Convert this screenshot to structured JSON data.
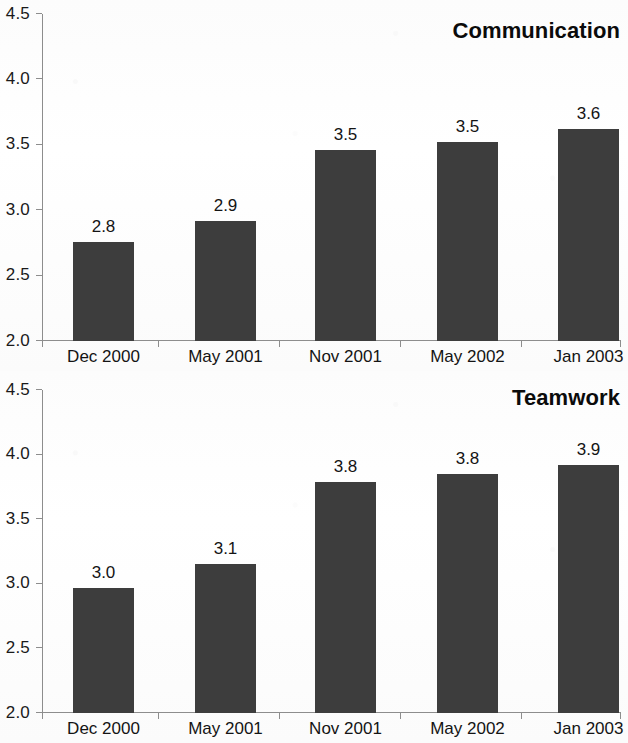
{
  "chart_data": [
    {
      "type": "bar",
      "title": "Communication",
      "categories": [
        "Dec 2000",
        "May 2001",
        "Nov 2001",
        "May 2002",
        "Jan 2003"
      ],
      "values": [
        2.8,
        2.9,
        3.5,
        3.5,
        3.6
      ],
      "bar_tops": [
        2.76,
        2.92,
        3.46,
        3.52,
        3.62
      ],
      "labels": [
        "2.8",
        "2.9",
        "3.5",
        "3.5",
        "3.6"
      ],
      "xlabel": "",
      "ylabel": "",
      "ylim": [
        2.0,
        4.5
      ],
      "ytick_labels": [
        "4.5",
        "4.0",
        "3.5",
        "3.0",
        "2.5",
        "2.0"
      ],
      "ytick_values": [
        4.5,
        4.0,
        3.5,
        3.0,
        2.5,
        2.0
      ],
      "grid": false,
      "legend": "none",
      "bar_color": "#3d3d3d",
      "axis_color": "#8d8d8d",
      "text_color": "#141414"
    },
    {
      "type": "bar",
      "title": "Teamwork",
      "categories": [
        "Dec 2000",
        "May 2001",
        "Nov 2001",
        "May 2002",
        "Jan 2003"
      ],
      "values": [
        3.0,
        3.1,
        3.8,
        3.8,
        3.9
      ],
      "bar_tops": [
        2.97,
        3.15,
        3.79,
        3.85,
        3.92
      ],
      "labels": [
        "3.0",
        "3.1",
        "3.8",
        "3.8",
        "3.9"
      ],
      "xlabel": "",
      "ylabel": "",
      "ylim": [
        2.0,
        4.5
      ],
      "ytick_labels": [
        "4.5",
        "4.0",
        "3.5",
        "3.0",
        "2.5",
        "2.0"
      ],
      "ytick_values": [
        4.5,
        4.0,
        3.5,
        3.0,
        2.5,
        2.0
      ],
      "grid": false,
      "legend": "none",
      "bar_color": "#3d3d3d",
      "axis_color": "#8d8d8d",
      "text_color": "#141414"
    }
  ]
}
